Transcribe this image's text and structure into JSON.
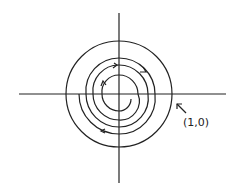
{
  "diagram": {
    "type": "spiral-phase-portrait",
    "label": "(1,0)",
    "colors": {
      "stroke": "#222222",
      "background": "#ffffff"
    }
  }
}
